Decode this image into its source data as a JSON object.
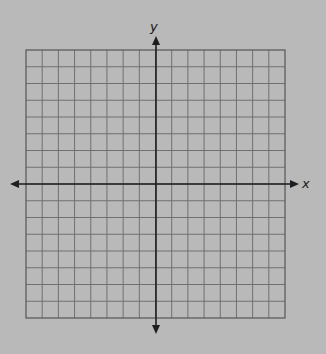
{
  "diagram": {
    "type": "coordinate-plane",
    "axes": {
      "x_label": "x",
      "y_label": "y"
    },
    "grid": {
      "columns": 16,
      "rows": 16,
      "origin_col": 8,
      "origin_row": 8
    },
    "colors": {
      "background": "#b9b9b9",
      "grid_line": "#707070",
      "axis": "#1e1e1e",
      "border": "#555555"
    }
  }
}
